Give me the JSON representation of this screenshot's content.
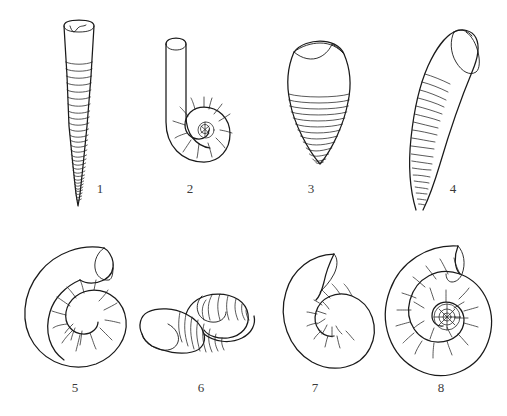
{
  "plate": {
    "title": "Cephalopod shell form plate",
    "background_color": "#ffffff",
    "ink_color": "#1a1a1a",
    "label_color": "#3a3a3a",
    "width": 507,
    "height": 416,
    "rows": 2,
    "columns": 4,
    "figure_count": 8
  },
  "figures": [
    {
      "number": "1",
      "name": "orthocone",
      "description": "long straight tapering cone with apical point and horizontal septal rings, aperture at top with notch",
      "row": 1,
      "column": 1,
      "label_x": 88,
      "label_y": 182
    },
    {
      "number": "2",
      "name": "lituiticone",
      "description": "tight basal spiral coil with long straight shaft rising vertically, aperture at top",
      "row": 1,
      "column": 2,
      "label_x": 178,
      "label_y": 182
    },
    {
      "number": "3",
      "name": "brevicone",
      "description": "short stout egg shaped shell, smooth upper body chamber, closely spaced horizontal septa over lower half",
      "row": 1,
      "column": 3,
      "label_x": 299,
      "label_y": 182
    },
    {
      "number": "4",
      "name": "cyrtocone",
      "description": "gently curved cone, aperture flaring at upper right, fine oblique septal lines along lower outer curve",
      "row": 1,
      "column": 4,
      "label_x": 441,
      "label_y": 182
    },
    {
      "number": "5",
      "name": "gyrocone",
      "description": "open loosely coiled spiral, whorls not in contact, large open aperture at upper right",
      "row": 2,
      "column": 1,
      "label_x": 63,
      "label_y": 381
    },
    {
      "number": "6",
      "name": "torticone",
      "description": "helically coiled trochospiral shell shown obliquely, ribbed whorls with straight apertural section at lower left",
      "row": 2,
      "column": 2,
      "label_x": 189,
      "label_y": 381
    },
    {
      "number": "7",
      "name": "nautilicone",
      "description": "tightly coiled involute shell, small central umbilicus with few visible inner whorls",
      "row": 2,
      "column": 3,
      "label_x": 303,
      "label_y": 381
    },
    {
      "number": "8",
      "name": "ammoniticone",
      "description": "evolute planispiral coil with broad umbilicus exposing many ribbed inner whorls",
      "row": 2,
      "column": 4,
      "label_x": 429,
      "label_y": 381
    }
  ]
}
